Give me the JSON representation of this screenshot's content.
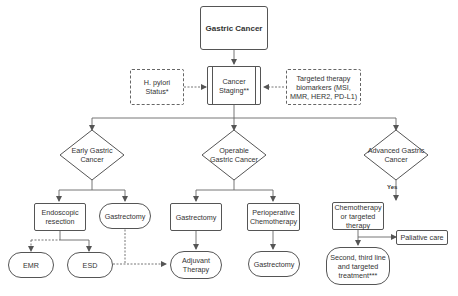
{
  "diagram": {
    "title": "Gastric Cancer",
    "staging": "Cancer Staging**",
    "hpylori": "H. pylori Status*",
    "biomarkers": "Targeted therapy biomarkers (MSI, MMR,  HER2, PD-L1)",
    "decisions": {
      "early": "Early Gastric Cancer",
      "operable": "Operable Gastric Cancer",
      "advanced": "Advanced Gastric Cancer"
    },
    "yes_label": "Yes",
    "early_branch": {
      "endoscopic": "Endoscopic resection",
      "gastrectomy": "Gastrectomy",
      "emr": "EMR",
      "esd": "ESD"
    },
    "operable_branch": {
      "gastrectomy": "Gastrectomy",
      "periop": "Perioperative Chemotherapy",
      "adjuvant": "Adjuvant Therapy",
      "gastrectomy2": "Gastrectomy"
    },
    "advanced_branch": {
      "chemo": "Chemotherapy or targeted therapy",
      "palliative": "Paliative care",
      "second_line": "Second, third line and targeted treatment***"
    }
  }
}
